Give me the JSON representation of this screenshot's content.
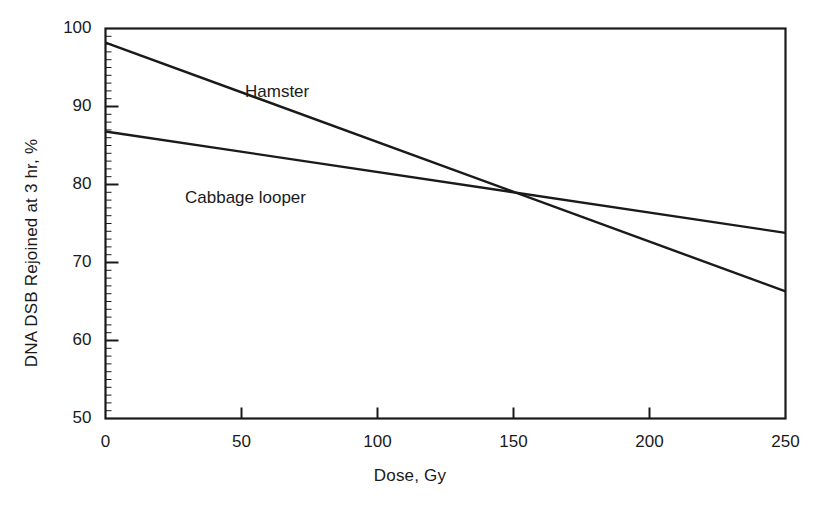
{
  "chart_data": {
    "type": "line",
    "title": "",
    "xlabel": "Dose, Gy",
    "ylabel": "DNA DSB Rejoined at 3 hr, %",
    "xlim": [
      0,
      250
    ],
    "ylim": [
      50,
      100
    ],
    "xticks": [
      0,
      50,
      100,
      150,
      200,
      250
    ],
    "yticks": [
      50,
      60,
      70,
      80,
      90,
      100
    ],
    "xtick_labels": [
      "0",
      "50",
      "100",
      "150",
      "200",
      "250"
    ],
    "ytick_labels": [
      "50",
      "60",
      "70",
      "80",
      "90",
      "100"
    ],
    "grid": false,
    "legend_position": "inline-annotation",
    "series": [
      {
        "name": "Hamster",
        "label": "Hamster",
        "color": "#1a1a1a",
        "x": [
          0,
          250
        ],
        "values": [
          98.2,
          66.3
        ],
        "label_x": 245,
        "label_y": 82
      },
      {
        "name": "Cabbage looper",
        "label": "Cabbage looper",
        "color": "#1a1a1a",
        "x": [
          0,
          250
        ],
        "values": [
          86.8,
          73.8
        ],
        "label_x": 185,
        "label_y": 188
      }
    ],
    "annotations": [
      {
        "text": "lines cross",
        "x": 150,
        "y": 79.8
      }
    ]
  },
  "axes": {
    "frame_color": "#1a1a1a",
    "line_color": "#1a1a1a"
  }
}
